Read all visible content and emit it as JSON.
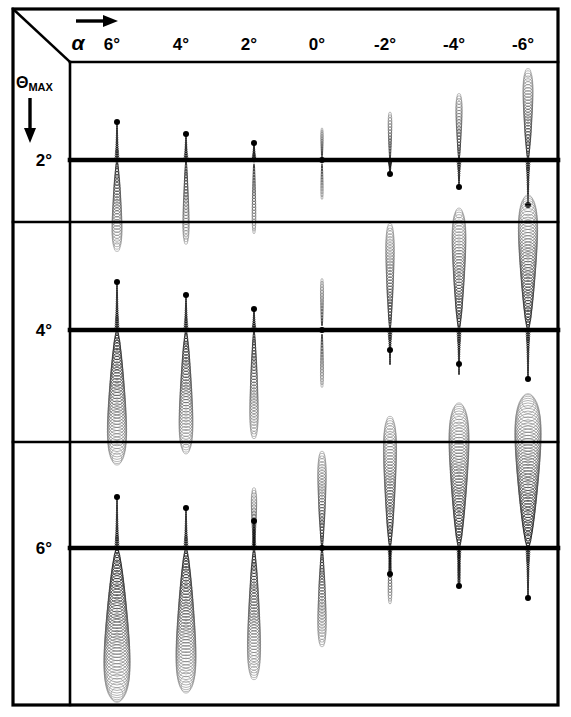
{
  "figure": {
    "column_axis_label": "α",
    "row_axis_label_main": "Θ",
    "row_axis_label_sub": "MAX",
    "column_arrow_icon": "arrow-right-icon",
    "row_arrow_icon": "arrow-down-icon",
    "frame_color": "#000000",
    "ink_color": "#000000",
    "background_color": "#ffffff"
  },
  "columns": [
    {
      "label": "6°",
      "value": 6,
      "x": 117
    },
    {
      "label": "4°",
      "value": 4,
      "x": 186
    },
    {
      "label": "2°",
      "value": 2,
      "x": 254
    },
    {
      "label": "0°",
      "value": 0,
      "x": 322
    },
    {
      "label": "-2°",
      "value": -2,
      "x": 390
    },
    {
      "label": "-4°",
      "value": -4,
      "x": 459
    },
    {
      "label": "-6°",
      "value": -6,
      "x": 528
    }
  ],
  "rows": [
    {
      "label": "2°",
      "value": 2,
      "top": 62,
      "bottom": 222,
      "baseline": 160
    },
    {
      "label": "4°",
      "value": 4,
      "top": 222,
      "bottom": 442,
      "baseline": 330
    },
    {
      "label": "6°",
      "value": 6,
      "top": 442,
      "bottom": 705,
      "baseline": 548
    }
  ],
  "chart_data": {
    "type": "scatter",
    "xlabel": "α",
    "ylabel": "ΘMAX",
    "grid": false,
    "legend": null,
    "x_categories": [
      "6°",
      "4°",
      "2°",
      "0°",
      "-2°",
      "-4°",
      "-6°"
    ],
    "y_categories": [
      "2°",
      "4°",
      "6°"
    ],
    "cells": [
      {
        "row": "2°",
        "col": "6°",
        "dot_dy": -38,
        "up_len": 0,
        "up_w": 0,
        "down_len": 90,
        "down_w": 13,
        "spike_up": 38,
        "spike_down": 0
      },
      {
        "row": "2°",
        "col": "4°",
        "dot_dy": -26,
        "up_len": 0,
        "up_w": 0,
        "down_len": 84,
        "down_w": 8,
        "spike_up": 26,
        "spike_down": 0
      },
      {
        "row": "2°",
        "col": "2°",
        "dot_dy": -17,
        "up_len": 0,
        "up_w": 0,
        "down_len": 74,
        "down_w": 5,
        "spike_up": 17,
        "spike_down": 0
      },
      {
        "row": "2°",
        "col": "0°",
        "dot_dy": 0,
        "up_len": 32,
        "up_w": 3,
        "down_len": 40,
        "down_w": 3,
        "spike_up": 0,
        "spike_down": 0
      },
      {
        "row": "2°",
        "col": "-2°",
        "dot_dy": 14,
        "up_len": 48,
        "up_w": 5,
        "down_len": 0,
        "down_w": 0,
        "spike_up": 0,
        "spike_down": 14
      },
      {
        "row": "2°",
        "col": "-4°",
        "dot_dy": 27,
        "up_len": 66,
        "up_w": 8,
        "down_len": 0,
        "down_w": 0,
        "spike_up": 0,
        "spike_down": 27
      },
      {
        "row": "2°",
        "col": "-6°",
        "dot_dy": 45,
        "up_len": 90,
        "up_w": 13,
        "down_len": 0,
        "down_w": 0,
        "spike_up": 0,
        "spike_down": 45
      },
      {
        "row": "4°",
        "col": "6°",
        "dot_dy": -48,
        "up_len": 0,
        "up_w": 0,
        "down_len": 132,
        "down_w": 25,
        "spike_up": 48,
        "spike_down": 0
      },
      {
        "row": "4°",
        "col": "4°",
        "dot_dy": -35,
        "up_len": 0,
        "up_w": 0,
        "down_len": 122,
        "down_w": 18,
        "spike_up": 35,
        "spike_down": 0
      },
      {
        "row": "4°",
        "col": "2°",
        "dot_dy": -21,
        "up_len": 0,
        "up_w": 0,
        "down_len": 108,
        "down_w": 11,
        "spike_up": 21,
        "spike_down": 0
      },
      {
        "row": "4°",
        "col": "0°",
        "dot_dy": 0,
        "up_len": 52,
        "up_w": 4,
        "down_len": 58,
        "down_w": 4,
        "spike_up": 0,
        "spike_down": 0
      },
      {
        "row": "4°",
        "col": "-2°",
        "dot_dy": 20,
        "up_len": 106,
        "up_w": 11,
        "down_len": 0,
        "down_w": 0,
        "spike_up": 0,
        "spike_down": 34
      },
      {
        "row": "4°",
        "col": "-4°",
        "dot_dy": 34,
        "up_len": 120,
        "up_w": 18,
        "down_len": 0,
        "down_w": 0,
        "spike_up": 0,
        "spike_down": 44
      },
      {
        "row": "4°",
        "col": "-6°",
        "dot_dy": 49,
        "up_len": 132,
        "up_w": 25,
        "down_len": 0,
        "down_w": 0,
        "spike_up": 0,
        "spike_down": 49
      },
      {
        "row": "6°",
        "col": "6°",
        "dot_dy": -51,
        "up_len": 0,
        "up_w": 0,
        "down_len": 150,
        "down_w": 34,
        "spike_up": 51,
        "spike_down": 0
      },
      {
        "row": "6°",
        "col": "4°",
        "dot_dy": -40,
        "up_len": 0,
        "up_w": 0,
        "down_len": 142,
        "down_w": 26,
        "spike_up": 40,
        "spike_down": 0
      },
      {
        "row": "6°",
        "col": "2°",
        "dot_dy": -27,
        "up_len": 60,
        "up_w": 7,
        "down_len": 130,
        "down_w": 17,
        "spike_up": 27,
        "spike_down": 0
      },
      {
        "row": "6°",
        "col": "0°",
        "dot_dy": 0,
        "up_len": 96,
        "up_w": 11,
        "down_len": 98,
        "down_w": 11,
        "spike_up": 0,
        "spike_down": 0
      },
      {
        "row": "6°",
        "col": "-2°",
        "dot_dy": 26,
        "up_len": 130,
        "up_w": 17,
        "down_len": 56,
        "down_w": 5,
        "spike_up": 0,
        "spike_down": 26
      },
      {
        "row": "6°",
        "col": "-4°",
        "dot_dy": 38,
        "up_len": 142,
        "up_w": 26,
        "down_len": 40,
        "down_w": 4,
        "spike_up": 0,
        "spike_down": 38
      },
      {
        "row": "6°",
        "col": "-6°",
        "dot_dy": 50,
        "up_len": 150,
        "up_w": 34,
        "down_len": 0,
        "down_w": 0,
        "spike_up": 0,
        "spike_down": 50
      }
    ]
  },
  "geometry": {
    "frame_left": 13,
    "frame_right": 558,
    "frame_top": 9,
    "frame_bottom": 705,
    "label_col_right": 70,
    "header_bottom": 62,
    "diagonal_from_x": 13,
    "diagonal_from_y": 9,
    "diagonal_to_x": 70,
    "diagonal_to_y": 62
  }
}
